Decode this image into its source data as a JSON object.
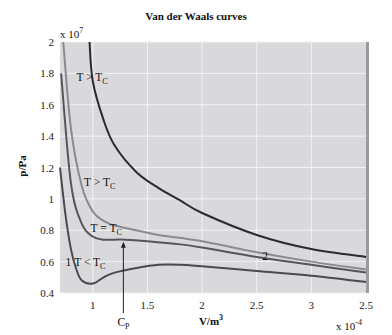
{
  "chart_data": {
    "type": "line",
    "title": "Van der Waals curves",
    "xlabel": "V/m^3",
    "ylabel": "p/Pa",
    "x_multiplier": "x 10^-4",
    "y_multiplier": "x 10^7",
    "xlim": [
      0.7,
      3.5
    ],
    "ylim": [
      0.4,
      2.0
    ],
    "x_tick_labels": [
      "1",
      "1.5",
      "2",
      "2.5",
      "3",
      "2.5"
    ],
    "y_tick_labels": [
      "2",
      "1.8",
      "1.6",
      "1.4",
      "1.2",
      "1",
      "0.8",
      "0.6",
      "0.4"
    ],
    "grid": true,
    "series": [
      {
        "name": "T > T_C (high)",
        "color": "#2a2a30",
        "x": [
          0.97,
          1.0,
          1.1,
          1.2,
          1.4,
          1.6,
          1.8,
          2.0,
          2.5,
          3.0,
          3.5
        ],
        "y": [
          2.0,
          1.75,
          1.5,
          1.34,
          1.17,
          1.07,
          0.99,
          0.91,
          0.77,
          0.68,
          0.63
        ]
      },
      {
        "name": "T > T_C",
        "color": "#8a8a92",
        "x": [
          0.73,
          0.8,
          0.9,
          1.0,
          1.1,
          1.2,
          1.4,
          1.6,
          2.0,
          2.5,
          3.0,
          3.5
        ],
        "y": [
          2.0,
          1.45,
          1.08,
          0.92,
          0.86,
          0.83,
          0.8,
          0.77,
          0.73,
          0.66,
          0.6,
          0.55
        ]
      },
      {
        "name": "T = T_C",
        "color": "#55555c",
        "x": [
          0.71,
          0.8,
          0.9,
          1.0,
          1.1,
          1.2,
          1.3,
          1.5,
          1.8,
          2.0,
          2.5,
          3.0,
          3.5
        ],
        "y": [
          1.8,
          1.1,
          0.84,
          0.76,
          0.74,
          0.74,
          0.74,
          0.73,
          0.71,
          0.69,
          0.63,
          0.58,
          0.53
        ]
      },
      {
        "name": "T < T_C",
        "color": "#4a4a52",
        "x": [
          0.7,
          0.75,
          0.8,
          0.85,
          0.9,
          1.0,
          1.1,
          1.2,
          1.4,
          1.6,
          1.8,
          2.0,
          2.5,
          3.0,
          3.5
        ],
        "y": [
          1.2,
          0.9,
          0.68,
          0.55,
          0.48,
          0.46,
          0.5,
          0.53,
          0.56,
          0.58,
          0.58,
          0.57,
          0.54,
          0.51,
          0.47
        ]
      }
    ],
    "annotations": [
      {
        "text": "T > T_C",
        "x": 0.85,
        "y": 1.75
      },
      {
        "text": "T > T_C",
        "x": 0.92,
        "y": 1.08
      },
      {
        "text": "T = T_C",
        "x": 0.98,
        "y": 0.79
      },
      {
        "text": "T < T_C",
        "x": 0.83,
        "y": 0.57
      },
      {
        "text": "1",
        "x": 0.75,
        "y": 0.57
      },
      {
        "text": "2",
        "x": 2.55,
        "y": 0.61
      },
      {
        "text": "C_P",
        "x": 1.28,
        "y": "below axis",
        "arrow_to": 0.74
      }
    ]
  },
  "labels": {
    "title": "Van der Waals curves",
    "y_mult_base": "x 10",
    "y_mult_exp": "7",
    "x_mult_base": "x 10",
    "x_mult_exp": "-4",
    "ylabel": "p/Pa",
    "xlabel_base": "V/m",
    "xlabel_exp": "3"
  }
}
